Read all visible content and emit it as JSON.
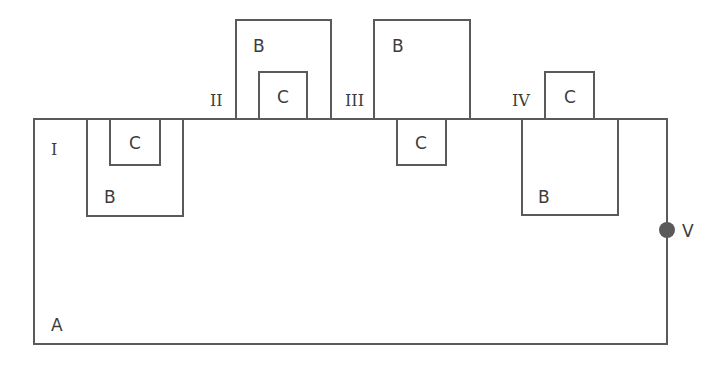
{
  "diagram": {
    "outer_region": {
      "label": "A"
    },
    "terminal": {
      "label": "V",
      "color": "#5a5a5a"
    },
    "cases": [
      {
        "id": "I",
        "label": "I",
        "outer_label": "B",
        "inner_label": "C",
        "b_position": "below surface",
        "c_position": "below surface, inside B"
      },
      {
        "id": "II",
        "label": "II",
        "outer_label": "B",
        "inner_label": "C",
        "b_position": "above surface",
        "c_position": "above surface, inside B"
      },
      {
        "id": "III",
        "label": "III",
        "outer_label": "B",
        "inner_label": "C",
        "b_position": "above surface",
        "c_position": "below surface"
      },
      {
        "id": "IV",
        "label": "IV",
        "outer_label": "B",
        "inner_label": "C",
        "b_position": "below surface",
        "c_position": "above surface"
      }
    ],
    "stroke_color": "#5a5a5a"
  }
}
